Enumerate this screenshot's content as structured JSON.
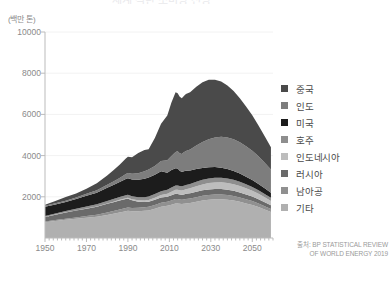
{
  "figure": {
    "title": "세계 석탄 소비량 전망",
    "y_unit_label": "(백만 톤)",
    "source_line1": "출처: BP STATISTICAL REVIEW",
    "source_line2": "OF WORLD ENERGY 2019"
  },
  "legend": {
    "items": [
      {
        "label": "중국",
        "color": "#4a4a4a"
      },
      {
        "label": "인도",
        "color": "#7d7d7d"
      },
      {
        "label": "미국",
        "color": "#1c1c1c"
      },
      {
        "label": "호주",
        "color": "#8e8e8e"
      },
      {
        "label": "인도네시아",
        "color": "#bdbdbd"
      },
      {
        "label": "러시아",
        "color": "#6a6a6a"
      },
      {
        "label": "남아공",
        "color": "#909090"
      },
      {
        "label": "기타",
        "color": "#b0b0b0"
      }
    ]
  },
  "chart_data": {
    "type": "area",
    "title": "세계 석탄 소비량 전망",
    "xlabel": "",
    "ylabel": "(백만 톤)",
    "xlim": [
      1950,
      2060
    ],
    "ylim": [
      0,
      10000
    ],
    "xticks": [
      1950,
      1970,
      1990,
      2010,
      2030,
      2050
    ],
    "yticks": [
      2000,
      4000,
      6000,
      8000,
      10000
    ],
    "grid": true,
    "legend_position": "right",
    "stacked": true,
    "stack_order_top_to_bottom": [
      "중국",
      "인도",
      "미국",
      "호주",
      "인도네시아",
      "러시아",
      "남아공",
      "기타"
    ],
    "x": [
      1950,
      1955,
      1960,
      1965,
      1970,
      1975,
      1980,
      1983,
      1986,
      1989,
      1990,
      1992,
      1995,
      1998,
      2000,
      2003,
      2006,
      2009,
      2011,
      2013,
      2014,
      2015,
      2016,
      2017,
      2018,
      2020,
      2023,
      2026,
      2029,
      2032,
      2035,
      2038,
      2041,
      2044,
      2047,
      2050,
      2053,
      2056,
      2059
    ],
    "series": [
      {
        "name": "기타",
        "values": [
          760,
          820,
          880,
          930,
          980,
          1030,
          1120,
          1180,
          1240,
          1300,
          1320,
          1300,
          1300,
          1320,
          1340,
          1420,
          1520,
          1560,
          1620,
          1680,
          1680,
          1660,
          1650,
          1660,
          1680,
          1700,
          1760,
          1820,
          1860,
          1880,
          1880,
          1860,
          1820,
          1760,
          1680,
          1600,
          1500,
          1380,
          1260
        ]
      },
      {
        "name": "남아공",
        "values": [
          40,
          50,
          60,
          70,
          85,
          100,
          120,
          130,
          145,
          155,
          160,
          160,
          165,
          170,
          175,
          185,
          195,
          200,
          205,
          210,
          210,
          208,
          206,
          206,
          208,
          212,
          220,
          226,
          230,
          232,
          230,
          226,
          220,
          212,
          202,
          192,
          180,
          166,
          152
        ]
      },
      {
        "name": "러시아",
        "values": [
          220,
          260,
          300,
          330,
          360,
          390,
          420,
          430,
          440,
          440,
          430,
          370,
          300,
          260,
          250,
          250,
          250,
          240,
          250,
          255,
          250,
          245,
          245,
          250,
          255,
          258,
          264,
          268,
          270,
          270,
          266,
          260,
          252,
          242,
          230,
          218,
          204,
          188,
          172
        ]
      },
      {
        "name": "인도네시아",
        "values": [
          5,
          6,
          8,
          10,
          12,
          15,
          20,
          25,
          32,
          40,
          44,
          50,
          62,
          72,
          80,
          100,
          125,
          150,
          175,
          200,
          205,
          205,
          210,
          218,
          228,
          240,
          265,
          288,
          305,
          318,
          325,
          326,
          322,
          312,
          298,
          282,
          262,
          240,
          218
        ]
      },
      {
        "name": "호주",
        "values": [
          45,
          55,
          65,
          78,
          92,
          105,
          120,
          128,
          136,
          145,
          148,
          150,
          155,
          160,
          165,
          175,
          185,
          192,
          198,
          204,
          204,
          202,
          202,
          204,
          206,
          210,
          216,
          222,
          226,
          228,
          226,
          222,
          216,
          208,
          198,
          188,
          176,
          162,
          148
        ]
      },
      {
        "name": "미국",
        "values": [
          450,
          440,
          430,
          470,
          520,
          560,
          640,
          680,
          720,
          790,
          800,
          810,
          840,
          900,
          930,
          940,
          960,
          830,
          850,
          840,
          830,
          740,
          690,
          700,
          690,
          660,
          620,
          580,
          545,
          515,
          485,
          455,
          425,
          395,
          365,
          335,
          305,
          275,
          245
        ]
      },
      {
        "name": "인도",
        "values": [
          40,
          50,
          62,
          78,
          95,
          115,
          145,
          170,
          200,
          235,
          250,
          275,
          320,
          360,
          390,
          430,
          500,
          600,
          680,
          790,
          830,
          850,
          880,
          920,
          960,
          1020,
          1140,
          1260,
          1360,
          1440,
          1500,
          1530,
          1540,
          1520,
          1480,
          1420,
          1340,
          1240,
          1130
        ]
      },
      {
        "name": "중국",
        "values": [
          60,
          110,
          180,
          190,
          250,
          340,
          450,
          540,
          640,
          760,
          790,
          810,
          980,
          1030,
          980,
          1360,
          1810,
          2180,
          2600,
          2900,
          2820,
          2750,
          2700,
          2740,
          2760,
          2780,
          2860,
          2900,
          2880,
          2800,
          2680,
          2520,
          2340,
          2140,
          1930,
          1720,
          1500,
          1290,
          1080
        ]
      }
    ]
  }
}
